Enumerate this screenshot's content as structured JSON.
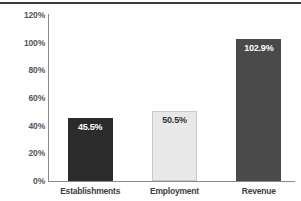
{
  "chart_data": {
    "type": "bar",
    "title": "",
    "subtitle": "",
    "xlabel": "",
    "ylabel": "",
    "categories": [
      "Establishments",
      "Employment",
      "Revenue"
    ],
    "values": [
      45.5,
      50.5,
      102.9
    ],
    "value_labels": [
      "45.5%",
      "50.5%",
      "102.9%"
    ],
    "unit": "%",
    "ylim": [
      0,
      120
    ],
    "ytick_values": [
      0,
      20,
      40,
      60,
      80,
      100,
      120
    ],
    "ytick_labels": [
      "0%",
      "20%",
      "40%",
      "60%",
      "80%",
      "100%",
      "120%"
    ],
    "grid": false,
    "legend": false,
    "legend_position": "none",
    "series": [
      {
        "name": "Share",
        "values": [
          45.5,
          50.5,
          102.9
        ]
      }
    ],
    "bar_colors": [
      "#2b2b2b",
      "#e8e8e8",
      "#4a4a4a"
    ],
    "bar_label_colors": [
      "#ffffff",
      "#333333",
      "#ffffff"
    ],
    "bar_border_colors": [
      "#2b2b2b",
      "#c9c9c9",
      "#4a4a4a"
    ]
  },
  "axes": {
    "axis_line_color": "#8a8a8a",
    "tick_label_color": "#555555",
    "category_label_color": "#3d3d3d"
  },
  "frame": {
    "top_rule_color": "#3a3a3a",
    "background": "#ffffff"
  }
}
